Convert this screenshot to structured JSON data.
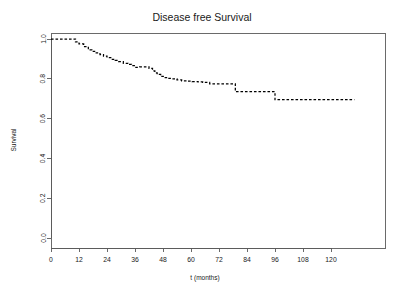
{
  "chart_data": {
    "type": "line",
    "subtype": "kaplan-meier-step",
    "title": "Disease free Survival",
    "xlabel": "t (months)",
    "ylabel": "Survival",
    "grid": false,
    "legend": null,
    "xlim": [
      0,
      132
    ],
    "ylim": [
      0.0,
      1.0
    ],
    "xticks": [
      0,
      12,
      24,
      36,
      48,
      60,
      72,
      84,
      96,
      108,
      120
    ],
    "xtick_labels": [
      "0",
      "12",
      "24",
      "36",
      "48",
      "60",
      "72",
      "84",
      "96",
      "108",
      "120"
    ],
    "yticks": [
      0.0,
      0.2,
      0.4,
      0.6,
      0.8,
      1.0
    ],
    "ytick_labels": [
      "0.0",
      "0.2",
      "0.4",
      "0.6",
      "0.8",
      "1.0"
    ],
    "line_style": "dashed",
    "line_color": "#000000",
    "series": [
      {
        "name": "Disease free survival",
        "x": [
          0,
          9.0,
          10.5,
          12.0,
          14.0,
          16.0,
          17.5,
          19.0,
          21.0,
          22.5,
          24.0,
          26.0,
          27.5,
          29.0,
          31.0,
          33.0,
          34.5,
          36.0,
          38.0,
          40.0,
          42.0,
          43.5,
          44.5,
          45.5,
          47.0,
          48.5,
          50.0,
          52.0,
          54.0,
          56.0,
          58.5,
          60.5,
          63.0,
          65.0,
          68.0,
          79.0,
          96.0,
          130.0
        ],
        "y": [
          1.0,
          1.0,
          0.985,
          0.975,
          0.962,
          0.945,
          0.938,
          0.93,
          0.922,
          0.914,
          0.906,
          0.898,
          0.892,
          0.886,
          0.878,
          0.872,
          0.866,
          0.858,
          0.86,
          0.86,
          0.852,
          0.84,
          0.83,
          0.822,
          0.812,
          0.806,
          0.802,
          0.8,
          0.794,
          0.79,
          0.788,
          0.786,
          0.784,
          0.782,
          0.775,
          0.735,
          0.695,
          0.695
        ]
      }
    ]
  },
  "plot": {
    "panel": {
      "left_px": 51,
      "top_px": 33,
      "right_px": 385,
      "bottom_px": 248
    },
    "x_axis_px": {
      "origin": 51,
      "px_per_12_months": 28
    },
    "y_axis_px": {
      "zero": 238,
      "one": 39
    }
  }
}
